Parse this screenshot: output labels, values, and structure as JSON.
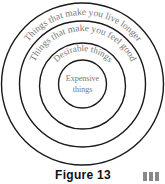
{
  "diagram": {
    "rings": [
      {
        "label": "Things that make you live longer",
        "radius": 80
      },
      {
        "label": "Things that make you feel good",
        "radius": 63
      },
      {
        "label": "Desirable things",
        "radius": 44
      },
      {
        "label_line1": "Expensive",
        "label_line2": "things",
        "radius": 23
      }
    ],
    "caption": "Figure 13"
  },
  "colors": {
    "ring": "#1a1a1a",
    "text": "#777777"
  }
}
